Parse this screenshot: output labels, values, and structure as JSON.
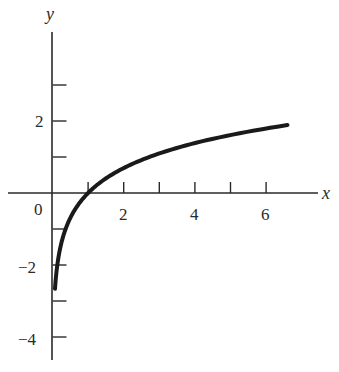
{
  "chart_data": {
    "type": "line",
    "title": "",
    "function": "y = ln x",
    "xlabel": "x",
    "ylabel": "y",
    "xlim": [
      -1.3,
      7.4
    ],
    "ylim": [
      -4.6,
      4.4
    ],
    "x_ticks": [
      1,
      2,
      3,
      4,
      5,
      6
    ],
    "x_tick_labels": [
      "",
      "2",
      "",
      "4",
      "",
      "6"
    ],
    "y_ticks": [
      3,
      2,
      1,
      -1,
      -2,
      -3,
      -4
    ],
    "y_tick_labels": [
      "",
      "2",
      "",
      "",
      "-2",
      "",
      "-4"
    ],
    "origin_label": "0",
    "grid": false,
    "legend": null,
    "series": [
      {
        "name": "ln x",
        "x": [
          0.07,
          0.1,
          0.2,
          0.3,
          0.5,
          0.75,
          1,
          1.5,
          2,
          3,
          4,
          5,
          6,
          6.6
        ],
        "y": [
          -2.66,
          -2.3,
          -1.61,
          -1.2,
          -0.69,
          -0.29,
          0,
          0.41,
          0.69,
          1.1,
          1.39,
          1.61,
          1.79,
          1.89
        ]
      }
    ]
  },
  "labels": {
    "x_axis": "x",
    "y_axis": "y",
    "origin": "0",
    "x2": "2",
    "x4": "4",
    "x6": "6",
    "y2": "2",
    "ym2": "−2",
    "ym4": "−4"
  }
}
